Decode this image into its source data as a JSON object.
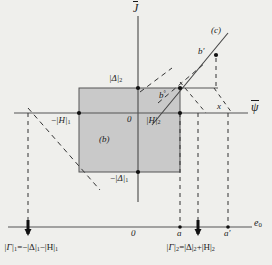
{
  "figure": {
    "kind": "mathematical-diagram",
    "background_color": "#efefec",
    "ink_color": "#1a1a1a",
    "region_fill": "#c9c9c9"
  },
  "axes": {
    "vertical_label": "J",
    "vertical_label_overbar": true,
    "horizontal_label": "ψ",
    "horizontal_label_overbar": true,
    "bottom_axis_label": "e",
    "bottom_axis_label_sub": "0",
    "origin_upper": "0",
    "origin_lower": "0"
  },
  "labels": {
    "delta2": "|Δ|",
    "delta2_sub": "2",
    "neg_delta1_sign": "−",
    "neg_delta1": "|Δ|",
    "neg_delta1_sub": "1",
    "neg_h1_sign": "−",
    "neg_h1": "|H|",
    "neg_h1_sub": "1",
    "h2": "|H|",
    "h2_sub": "2",
    "region_b": "(b)",
    "curve_c": "(c)",
    "point_b_circ": "b",
    "point_b_circ_sup": "°",
    "point_b_prime": "b′",
    "point_x": "x",
    "point_a": "a",
    "point_a_prime": "a′"
  },
  "formulas": {
    "left": {
      "lhs": "|Γ|",
      "lhs_sub": "1",
      "rhs": "=−|Δ|",
      "rhs_sub1": "1",
      "rhs_mid": "−|H|",
      "rhs_sub2": "1"
    },
    "right": {
      "lhs": "|Γ|",
      "lhs_sub": "2",
      "rhs": "=|Δ|",
      "rhs_sub1": "2",
      "rhs_mid": "+|H|",
      "rhs_sub2": "2"
    }
  },
  "geometry": {
    "origin_x": 138,
    "origin_y": 113,
    "rect_left": 79,
    "rect_right": 180,
    "rect_top": 88,
    "rect_bottom": 172,
    "bottom_axis_y": 227,
    "a_x": 180,
    "gamma2_x": 198,
    "a_prime_x": 228,
    "gamma1_x": 28,
    "b_circ_x": 180,
    "b_circ_y": 88,
    "b_prime_x": 213,
    "b_prime_y": 53
  }
}
